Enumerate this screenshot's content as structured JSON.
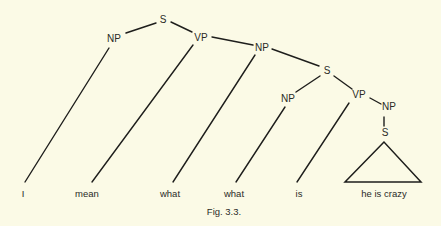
{
  "diagram": {
    "type": "syntax-tree",
    "caption": "Fig. 3.3.",
    "nodes": {
      "s_root": "S",
      "np_subject": "NP",
      "vp_main": "VP",
      "np_object": "NP",
      "s_embedded": "S",
      "np_embedded": "NP",
      "vp_embedded": "VP",
      "np_complement": "NP",
      "s_complement": "S"
    },
    "words": [
      "I",
      "mean",
      "what",
      "what",
      "is",
      "he is crazy"
    ]
  },
  "colors": {
    "background": "#fbfae6",
    "ink": "#1e1e1c"
  }
}
